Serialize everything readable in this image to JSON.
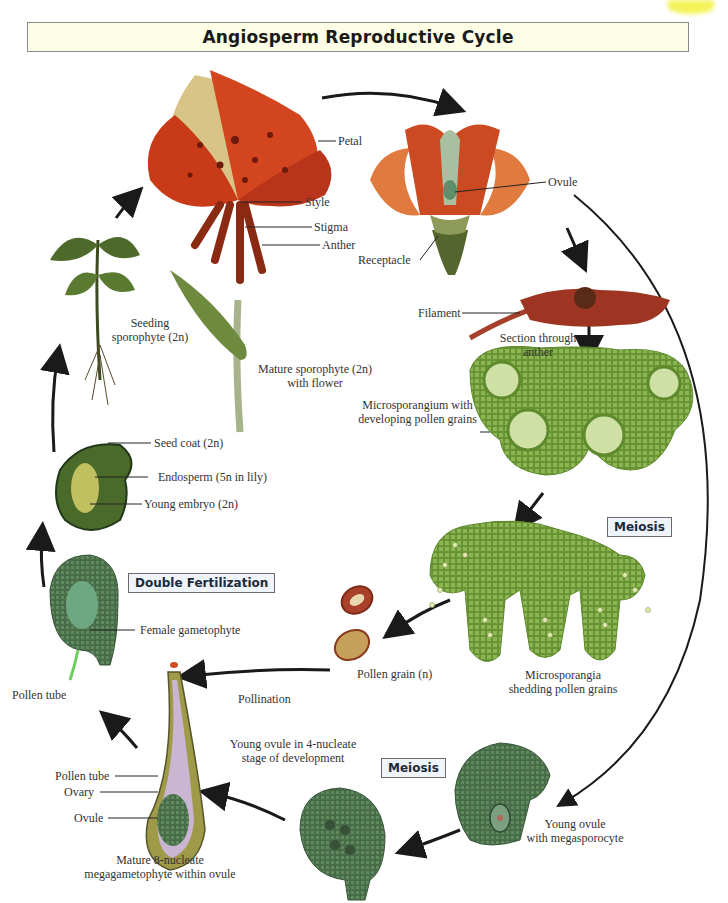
{
  "title": "Angiosperm Reproductive Cycle",
  "stage_boxes": {
    "double_fertilization": "Double Fertilization",
    "meiosis_upper": "Meiosis",
    "meiosis_lower": "Meiosis"
  },
  "labels": {
    "petal": "Petal",
    "style": "Style",
    "stigma": "Stigma",
    "anther": "Anther",
    "ovule_flower": "Ovule",
    "receptacle": "Receptacle",
    "filament": "Filament",
    "section_anther_1": "Section through",
    "section_anther_2": "anther",
    "seedling_1": "Seeding",
    "seedling_2": "sporophyte (2n)",
    "mature_1": "Mature sporophyte (2n)",
    "mature_2": "with flower",
    "seed_coat": "Seed coat (2n)",
    "endosperm": "Endosperm (5n in lily)",
    "young_embryo": "Young embryo (2n)",
    "microsporangium_1": "Microsporangium with",
    "microsporangium_2": "developing pollen grains",
    "female_gametophyte": "Female gametophyte",
    "pollen_tube_left": "Pollen tube",
    "pollen_grain": "Pollen grain (n)",
    "pollination": "Pollination",
    "microsporangia_1": "Microsporangia",
    "microsporangia_2": "shedding pollen grains",
    "young_ovule_4n_1": "Young ovule in 4-nucleate",
    "young_ovule_4n_2": "stage of development",
    "pollen_tube_ovary": "Pollen tube",
    "ovary": "Ovary",
    "ovule_ovary": "Ovule",
    "mature_8_1": "Mature 8-nucleate",
    "mature_8_2": "megagametophyte within ovule",
    "young_ovule_mega_1": "Young ovule",
    "young_ovule_mega_2": "with megasporocyte"
  },
  "colors": {
    "title_bg": "#fefee6",
    "stage_box_bg": "#eef4fa",
    "petal_red": "#d2451e",
    "tissue_green": "#7fa845",
    "ovule_green": "#4f7a58",
    "arrow": "#1a1a1a"
  }
}
